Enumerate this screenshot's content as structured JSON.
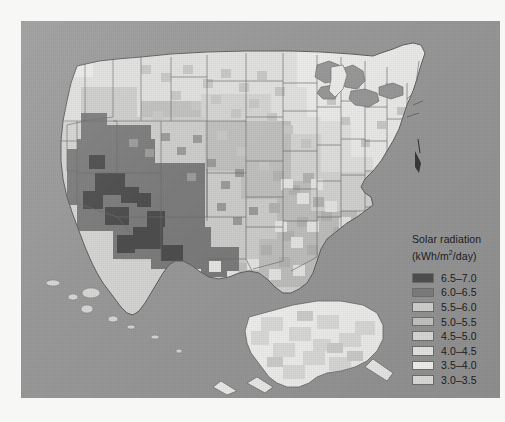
{
  "figure": {
    "kind": "choropleth-raster-map",
    "region": "United States with Alaska inset",
    "background_color": "#9a9a9a",
    "paper_color": "#f7f7f6",
    "outline_color": "#5f5f5f"
  },
  "legend": {
    "title_line1": "Solar radiation",
    "title_line2_prefix": "(kWh/m",
    "title_line2_sup": "2",
    "title_line2_suffix": "/day)",
    "entries": [
      {
        "label": "6.5–7.0",
        "color": "#4f4f4f",
        "min": 6.5,
        "max": 7.0
      },
      {
        "label": "6.0–6.5",
        "color": "#7d7d7d",
        "min": 6.0,
        "max": 6.5
      },
      {
        "label": "5.5–6.0",
        "color": "#cfcfcd",
        "min": 5.5,
        "max": 6.0
      },
      {
        "label": "5.0–5.5",
        "color": "#c2c2c0",
        "min": 5.0,
        "max": 5.5
      },
      {
        "label": "4.5–5.0",
        "color": "#d6d6d4",
        "min": 4.5,
        "max": 5.0
      },
      {
        "label": "4.0–4.5",
        "color": "#e2e2e0",
        "min": 4.0,
        "max": 4.5
      },
      {
        "label": "3.5–4.0",
        "color": "#ededeb",
        "min": 3.5,
        "max": 4.0
      },
      {
        "label": "3.0–3.5",
        "color": "#d9d9d7",
        "min": 3.0,
        "max": 3.5
      }
    ]
  },
  "chart_data": {
    "type": "heatmap",
    "title": "Solar radiation",
    "unit": "kWh/m2/day",
    "value_range": [
      3.0,
      7.0
    ],
    "class_count": 8,
    "class_width": 0.5,
    "legend_position": "bottom-right",
    "grid": false,
    "regions": [
      {
        "name": "Southwest Arizona",
        "value": 6.75,
        "class": "6.5–7.0"
      },
      {
        "name": "Southeast California",
        "value": 6.75,
        "class": "6.5–7.0"
      },
      {
        "name": "Southern Nevada",
        "value": 6.25,
        "class": "6.0–6.5"
      },
      {
        "name": "New Mexico",
        "value": 6.25,
        "class": "6.0–6.5"
      },
      {
        "name": "Utah",
        "value": 5.75,
        "class": "5.5–6.0"
      },
      {
        "name": "Colorado",
        "value": 5.75,
        "class": "5.5–6.0"
      },
      {
        "name": "West Texas",
        "value": 5.75,
        "class": "5.5–6.0"
      },
      {
        "name": "Great Plains",
        "value": 5.25,
        "class": "5.0–5.5"
      },
      {
        "name": "Pacific Northwest",
        "value": 4.25,
        "class": "4.0–4.5"
      },
      {
        "name": "Upper Midwest",
        "value": 4.25,
        "class": "4.0–4.5"
      },
      {
        "name": "Great Lakes",
        "value": 3.75,
        "class": "3.5–4.0"
      },
      {
        "name": "Northeast",
        "value": 3.75,
        "class": "3.5–4.0"
      },
      {
        "name": "Southeast",
        "value": 4.75,
        "class": "4.5–5.0"
      },
      {
        "name": "Florida",
        "value": 5.25,
        "class": "5.0–5.5"
      },
      {
        "name": "Alaska",
        "value": 3.25,
        "class": "3.0–3.5"
      }
    ]
  }
}
